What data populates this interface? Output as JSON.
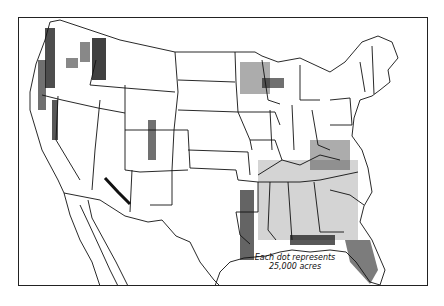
{
  "map": {
    "subject": "United States dot-density map",
    "legend": {
      "line1": "Each dot represents",
      "line2": "25,000 acres"
    },
    "colors": {
      "background": "#ffffff",
      "ink": "#111111"
    },
    "dense_regions": [
      "Pacific Northwest coast",
      "Northern Rockies (Idaho/Montana)",
      "Northern Great Lakes (Minnesota, Wisconsin, Michigan)",
      "Mogollon Rim (Arizona)",
      "Colorado Rockies",
      "Lower Mississippi Valley",
      "Gulf Coast",
      "Florida",
      "Appalachians"
    ]
  }
}
